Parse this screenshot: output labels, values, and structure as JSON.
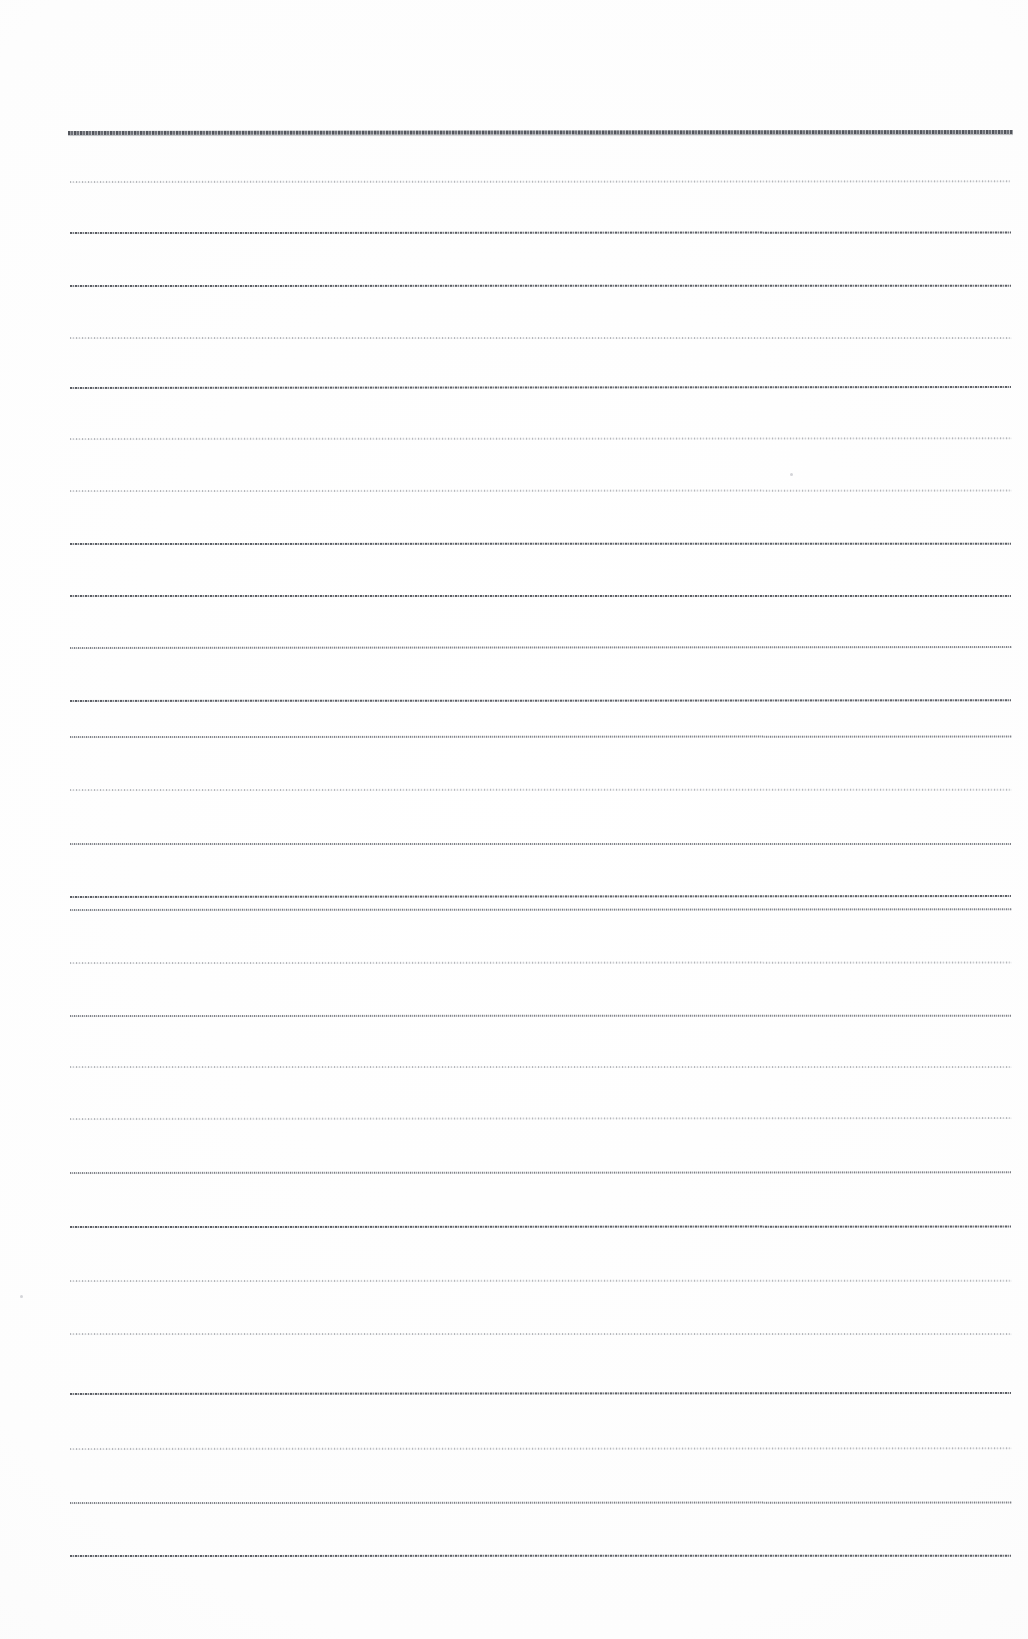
{
  "document": {
    "kind": "scanned-ruled-paper",
    "title": "Blank ruled paper scan",
    "content_text": "",
    "page_width": 1028,
    "page_height": 1639,
    "background_color": "#ffffff",
    "rule_color": "#5c5f66",
    "header_rule_color": "#4a4d54",
    "rule_spacing": 54,
    "rule_left": 70,
    "rule_right": 1012,
    "total_rules": 28,
    "written_lines": []
  },
  "chart_data": {
    "type": "table",
    "xlabel": "x extent (px)",
    "ylabel": "y position (px)",
    "grid": true,
    "legend": [],
    "columns": [
      "index",
      "y",
      "x_start",
      "x_end",
      "weight"
    ],
    "rows": [
      [
        0,
        131,
        68,
        1013,
        "header"
      ],
      [
        1,
        181,
        70,
        1010,
        "faint"
      ],
      [
        2,
        232,
        70,
        1011,
        "strong"
      ],
      [
        3,
        285,
        70,
        1011,
        "strong"
      ],
      [
        4,
        337,
        70,
        1012,
        "faint"
      ],
      [
        5,
        387,
        70,
        1011,
        "strong"
      ],
      [
        6,
        438,
        70,
        1012,
        "faint"
      ],
      [
        7,
        490,
        70,
        1012,
        "faint"
      ],
      [
        8,
        543,
        70,
        1011,
        "strong"
      ],
      [
        9,
        595,
        70,
        1011,
        "strong"
      ],
      [
        10,
        647,
        70,
        1012,
        "normal"
      ],
      [
        11,
        700,
        70,
        1011,
        "strong"
      ],
      [
        12,
        736,
        70,
        1012,
        "normal"
      ],
      [
        13,
        789,
        70,
        1012,
        "faint"
      ],
      [
        14,
        843,
        70,
        1011,
        "normal"
      ],
      [
        15,
        896,
        70,
        1011,
        "strong"
      ],
      [
        16,
        909,
        70,
        1012,
        "normal"
      ],
      [
        17,
        962,
        70,
        1012,
        "faint"
      ],
      [
        18,
        1015,
        70,
        1011,
        "normal"
      ],
      [
        19,
        1066,
        70,
        1012,
        "faint"
      ],
      [
        20,
        1118,
        70,
        1012,
        "faint"
      ],
      [
        21,
        1172,
        70,
        1011,
        "normal"
      ],
      [
        22,
        1226,
        70,
        1011,
        "strong"
      ],
      [
        23,
        1280,
        70,
        1012,
        "faint"
      ],
      [
        24,
        1333,
        70,
        1012,
        "faint"
      ],
      [
        25,
        1393,
        70,
        1011,
        "strong"
      ],
      [
        26,
        1448,
        70,
        1012,
        "faint"
      ],
      [
        27,
        1502,
        70,
        1012,
        "normal"
      ],
      [
        28,
        1555,
        70,
        1011,
        "strong"
      ]
    ],
    "specks": [
      [
        790,
        473,
        3
      ],
      [
        20,
        1295,
        3
      ]
    ]
  }
}
